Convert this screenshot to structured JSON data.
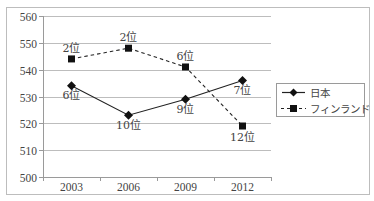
{
  "chart_data": {
    "type": "line",
    "title": "",
    "xlabel": "",
    "ylabel": "",
    "categories": [
      "2003",
      "2006",
      "2009",
      "2012"
    ],
    "ylim": [
      500,
      560
    ],
    "yticks": [
      500,
      510,
      520,
      530,
      540,
      550,
      560
    ],
    "grid": true,
    "legend_position": "right",
    "series": [
      {
        "name": "日本",
        "marker": "diamond",
        "line_style": "solid",
        "color": "#222222",
        "values": [
          534,
          523,
          529,
          536
        ],
        "labels": [
          "6位",
          "10位",
          "9位",
          "7位"
        ]
      },
      {
        "name": "フィンランド",
        "marker": "square",
        "line_style": "dashed",
        "color": "#222222",
        "values": [
          544,
          548,
          541,
          519
        ],
        "labels": [
          "2位",
          "2位",
          "6位",
          "12位"
        ]
      }
    ]
  },
  "legend": {
    "items": [
      {
        "label": "日本"
      },
      {
        "label": "フィンランド"
      }
    ]
  },
  "colors": {
    "grid": "#bdbdbd",
    "axis": "#9a9a9a",
    "line": "#222222"
  }
}
